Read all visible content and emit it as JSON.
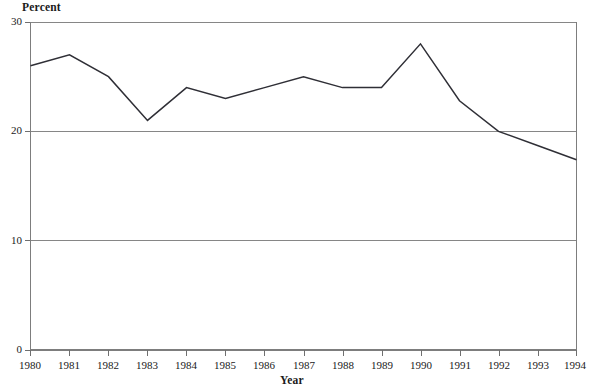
{
  "chart_data": {
    "type": "line",
    "title": "",
    "xlabel": "Year",
    "ylabel": "Percent",
    "categories": [
      "1980",
      "1981",
      "1982",
      "1983",
      "1984",
      "1985",
      "1986",
      "1987",
      "1988",
      "1989",
      "1990",
      "1991",
      "1992",
      "1993",
      "1994"
    ],
    "x": [
      1980,
      1981,
      1982,
      1983,
      1984,
      1985,
      1986,
      1987,
      1988,
      1989,
      1990,
      1991,
      1992,
      1993,
      1994
    ],
    "values": [
      26,
      27,
      25,
      21,
      24,
      23,
      24,
      25,
      24,
      24,
      28,
      22.8,
      20,
      18.7,
      17.4
    ],
    "series": [
      {
        "name": "Percent",
        "values": [
          26,
          27,
          25,
          21,
          24,
          23,
          24,
          25,
          24,
          24,
          28,
          22.8,
          20,
          18.7,
          17.4
        ]
      }
    ],
    "ylim": [
      0,
      30
    ],
    "xlim": [
      1980,
      1994
    ],
    "yticks": [
      0,
      10,
      20,
      30
    ],
    "ytick_labels": [
      "0",
      "10",
      "20",
      "30"
    ],
    "xticks": [
      1980,
      1981,
      1982,
      1983,
      1984,
      1985,
      1986,
      1987,
      1988,
      1989,
      1990,
      1991,
      1992,
      1993,
      1994
    ],
    "grid": "horizontal",
    "gridlines_at": [
      10,
      20,
      30
    ],
    "legend": "none",
    "line_color": "#2f2f36",
    "grid_color": "#868686",
    "background_color": "#ffffff"
  }
}
